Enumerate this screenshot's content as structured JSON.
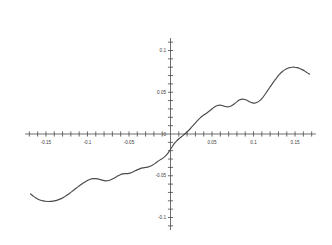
{
  "chart_data": {
    "type": "line",
    "title": "",
    "subtitle": "",
    "xlabel": "",
    "ylabel": "",
    "xlim": [
      -0.175,
      0.175
    ],
    "ylim": [
      -0.115,
      0.115
    ],
    "grid": false,
    "legend": null,
    "legend_position": "none",
    "x_tick_labels": [
      "-0.15",
      "-0.1",
      "-0.05",
      "0.05",
      "0.1",
      "0.15"
    ],
    "x_tick_values": [
      -0.15,
      -0.1,
      -0.05,
      0.05,
      0.1,
      0.15
    ],
    "y_tick_labels": [
      "0.1",
      "0.05",
      "0",
      "-0.05",
      "-0.1"
    ],
    "y_tick_values": [
      0.1,
      0.05,
      0,
      -0.05,
      -0.1
    ],
    "x_minor_tick_step": 0.01,
    "y_minor_tick_step": 0.01,
    "origin_label": "0",
    "series": [
      {
        "name": "f(x)",
        "color": "#4b4b4b",
        "x": [
          -0.1685,
          -0.1655,
          -0.1625,
          -0.1595,
          -0.1565,
          -0.1535,
          -0.1505,
          -0.1475,
          -0.1445,
          -0.1415,
          -0.1385,
          -0.1355,
          -0.1325,
          -0.1295,
          -0.1265,
          -0.1235,
          -0.1205,
          -0.1175,
          -0.1145,
          -0.1115,
          -0.1085,
          -0.1055,
          -0.1025,
          -0.0995,
          -0.0965,
          -0.0935,
          -0.0905,
          -0.0875,
          -0.0845,
          -0.0815,
          -0.0785,
          -0.0755,
          -0.0725,
          -0.0695,
          -0.0665,
          -0.0635,
          -0.0605,
          -0.0575,
          -0.0545,
          -0.0515,
          -0.0485,
          -0.0455,
          -0.0425,
          -0.0395,
          -0.0365,
          -0.0335,
          -0.0305,
          -0.0275,
          -0.0245,
          -0.0215,
          -0.0185,
          -0.0155,
          -0.0125,
          -0.0095,
          -0.0065,
          -0.0035,
          -0.0005,
          0.0025,
          0.0055,
          0.0085,
          0.0115,
          0.0145,
          0.0175,
          0.0205,
          0.0235,
          0.0265,
          0.0295,
          0.0325,
          0.0355,
          0.0385,
          0.0415,
          0.0445,
          0.0475,
          0.0505,
          0.0535,
          0.0565,
          0.0595,
          0.0625,
          0.0655,
          0.0685,
          0.0715,
          0.0745,
          0.0775,
          0.0805,
          0.0835,
          0.0865,
          0.0895,
          0.0925,
          0.0955,
          0.0985,
          0.1015,
          0.1045,
          0.1075,
          0.1105,
          0.1135,
          0.1165,
          0.1195,
          0.1225,
          0.1255,
          0.1285,
          0.1315,
          0.1345,
          0.1375,
          0.1405,
          0.1435,
          0.1465,
          0.1495,
          0.1525,
          0.1555,
          0.1585,
          0.1615,
          0.1645,
          0.1675
        ],
        "y": [
          -0.0718,
          -0.0742,
          -0.0764,
          -0.0781,
          -0.0793,
          -0.0801,
          -0.0806,
          -0.0808,
          -0.0807,
          -0.0804,
          -0.0798,
          -0.0789,
          -0.0777,
          -0.0762,
          -0.0744,
          -0.0724,
          -0.0702,
          -0.0679,
          -0.0656,
          -0.0633,
          -0.0611,
          -0.059,
          -0.0571,
          -0.0554,
          -0.0542,
          -0.0535,
          -0.0534,
          -0.0538,
          -0.0546,
          -0.0555,
          -0.0561,
          -0.056,
          -0.0551,
          -0.0537,
          -0.052,
          -0.0503,
          -0.0488,
          -0.0478,
          -0.0474,
          -0.0475,
          -0.0469,
          -0.0456,
          -0.0441,
          -0.0427,
          -0.0415,
          -0.0406,
          -0.0401,
          -0.0397,
          -0.0387,
          -0.0372,
          -0.0352,
          -0.033,
          -0.031,
          -0.0292,
          -0.0268,
          -0.0236,
          -0.0191,
          -0.0144,
          -0.0104,
          -0.0072,
          -0.0046,
          -0.0022,
          0.0003,
          0.003,
          0.006,
          0.0093,
          0.0128,
          0.0161,
          0.019,
          0.0215,
          0.0237,
          0.0258,
          0.0281,
          0.0305,
          0.0327,
          0.0341,
          0.0345,
          0.034,
          0.0331,
          0.0325,
          0.0329,
          0.0344,
          0.0367,
          0.0391,
          0.041,
          0.0418,
          0.0414,
          0.0401,
          0.0385,
          0.0373,
          0.037,
          0.0379,
          0.04,
          0.0431,
          0.047,
          0.0513,
          0.0557,
          0.0601,
          0.0643,
          0.0682,
          0.0716,
          0.0745,
          0.0768,
          0.0784,
          0.0795,
          0.08,
          0.08,
          0.0795,
          0.0785,
          0.0771,
          0.0754,
          0.0735,
          0.0717
        ]
      }
    ]
  },
  "axes": {
    "x_axis_name": "horizontal-axis",
    "y_axis_name": "vertical-axis"
  }
}
